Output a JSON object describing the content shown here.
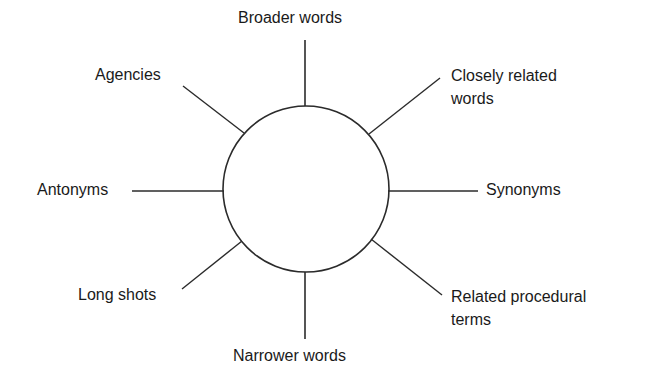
{
  "diagram": {
    "type": "hub-and-spoke",
    "center": {
      "label": "",
      "shape": "circle"
    },
    "spokes": [
      {
        "id": "top",
        "label": "Broader words",
        "direction": "north"
      },
      {
        "id": "top-right",
        "label_line1": "Closely related",
        "label_line2": "words",
        "direction": "north-east"
      },
      {
        "id": "right",
        "label": "Synonyms",
        "direction": "east"
      },
      {
        "id": "bottom-right",
        "label_line1": "Related procedural",
        "label_line2": "terms",
        "direction": "south-east"
      },
      {
        "id": "bottom",
        "label": "Narrower words",
        "direction": "south"
      },
      {
        "id": "bottom-left",
        "label": "Long shots",
        "direction": "south-west"
      },
      {
        "id": "left",
        "label": "Antonyms",
        "direction": "west"
      },
      {
        "id": "top-left",
        "label": "Agencies",
        "direction": "north-west"
      }
    ]
  },
  "colors": {
    "line": "#2b2b2b",
    "text": "#1a1a1a",
    "background": "#ffffff"
  }
}
